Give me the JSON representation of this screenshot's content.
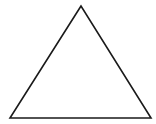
{
  "diagram": {
    "shape": "triangle",
    "stroke_color": "#1a1a1a",
    "fill_color": "#ffffff",
    "background_color": "#ffffff",
    "vertices": {
      "apex": [
        81,
        6
      ],
      "bottom_left": [
        10,
        118
      ],
      "bottom_right": [
        151,
        118
      ]
    }
  }
}
